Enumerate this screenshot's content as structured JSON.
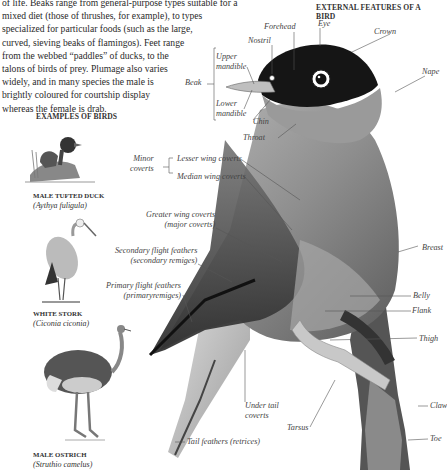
{
  "intro_lines": [
    "of life. Beaks range from general-purpose types suitable for a",
    "mixed diet (those of thrushes, for example), to types",
    "specialized for particular foods (such as the large,",
    "curved, sieving beaks of flamingos). Feet range",
    "from the webbed “paddles” of ducks, to the",
    "talons of birds of prey. Plumage also varies",
    "widely, and in many species the male is",
    "brightly coloured for courtship display",
    "whereas the female is drab."
  ],
  "headings": {
    "external_features": "EXTERNAL FEATURES OF A BIRD",
    "examples": "EXAMPLES OF BIRDS"
  },
  "examples": [
    {
      "name": "MALE TUFTED DUCK",
      "species": "(Aythya fuligula)"
    },
    {
      "name": "WHITE STORK",
      "species": "(Ciconia ciconia)"
    },
    {
      "name": "MALE OSTRICH",
      "species": "(Struthio camelus)"
    }
  ],
  "labels": {
    "forehead": "Forehead",
    "eye": "Eye",
    "crown": "Crown",
    "nostril": "Nostril",
    "nape": "Nape",
    "upper_mandible_1": "Upper",
    "upper_mandible_2": "mandible",
    "beak": "Beak",
    "lower_mandible_1": "Lower",
    "lower_mandible_2": "mandible",
    "chin": "Chin",
    "throat": "Throat",
    "minor_coverts_1": "Minor",
    "minor_coverts_2": "coverts",
    "lesser_wing_coverts": "Lesser wing coverts",
    "median_wing_coverts": "Median wing coverts",
    "greater_wing_coverts_1": "Greater wing coverts",
    "greater_wing_coverts_2": "(major coverts)",
    "secondary_flight_1": "Secondary flight feathers",
    "secondary_flight_2": "(secondary remiges)",
    "primary_flight_1": "Primary flight feathers",
    "primary_flight_2": "(primaryremiges)",
    "breast": "Breast",
    "belly": "Belly",
    "flank": "Flank",
    "thigh": "Thigh",
    "claw": "Claw",
    "toe": "Toe",
    "under_tail_1": "Under tail",
    "under_tail_2": "coverts",
    "tarsus": "Tarsus",
    "tail_feathers": "Tail feathers (retrices)"
  }
}
